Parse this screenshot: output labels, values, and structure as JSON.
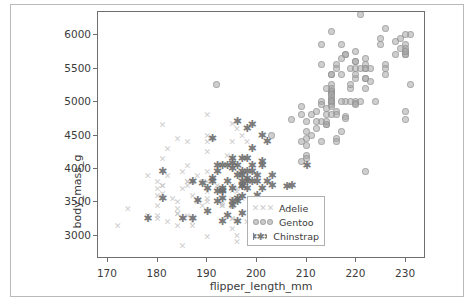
{
  "figure": {
    "background": "#ffffff",
    "frame_color": "#b9b9b9",
    "axes_edge_color": "#6e6e6e"
  },
  "chart_data": {
    "type": "scatter",
    "title": "",
    "xlabel": "flipper_length_mm",
    "ylabel": "body_mass_g",
    "xlim": [
      168,
      234
    ],
    "ylim": [
      2650,
      6350
    ],
    "xticks": [
      170,
      180,
      190,
      200,
      210,
      220,
      230
    ],
    "xticklabels": [
      "170",
      "180",
      "190",
      "200",
      "210",
      "220",
      "230"
    ],
    "yticks": [
      3000,
      3500,
      4000,
      4500,
      5000,
      5500,
      6000
    ],
    "yticklabels": [
      "3000",
      "3500",
      "4000",
      "4500",
      "5000",
      "5500",
      "6000"
    ],
    "grid": false,
    "legend": {
      "position": "lower right",
      "entries": [
        {
          "label": "Adelie",
          "marker": "x",
          "color": "#c4c4c4"
        },
        {
          "label": "Gentoo",
          "marker": "o",
          "color": "#a8a8a8"
        },
        {
          "label": "Chinstrap",
          "marker": "star",
          "color": "#6e6e6e"
        }
      ]
    },
    "series": [
      {
        "name": "Adelie",
        "marker": "x",
        "color": "#c4c4c4",
        "points": [
          [
            181,
            3750
          ],
          [
            186,
            3800
          ],
          [
            195,
            3250
          ],
          [
            193,
            3450
          ],
          [
            190,
            3650
          ],
          [
            181,
            3625
          ],
          [
            195,
            4675
          ],
          [
            193,
            3475
          ],
          [
            190,
            4250
          ],
          [
            186,
            3300
          ],
          [
            180,
            3700
          ],
          [
            182,
            3200
          ],
          [
            191,
            3800
          ],
          [
            198,
            4400
          ],
          [
            185,
            3700
          ],
          [
            195,
            3450
          ],
          [
            197,
            4500
          ],
          [
            184,
            3325
          ],
          [
            194,
            4200
          ],
          [
            174,
            3400
          ],
          [
            180,
            3600
          ],
          [
            189,
            3800
          ],
          [
            185,
            3950
          ],
          [
            180,
            3800
          ],
          [
            187,
            3800
          ],
          [
            183,
            3550
          ],
          [
            187,
            3200
          ],
          [
            172,
            3150
          ],
          [
            180,
            3250
          ],
          [
            178,
            3900
          ],
          [
            178,
            3300
          ],
          [
            188,
            3900
          ],
          [
            184,
            3325
          ],
          [
            195,
            4150
          ],
          [
            196,
            3950
          ],
          [
            190,
            3550
          ],
          [
            180,
            3300
          ],
          [
            181,
            4650
          ],
          [
            184,
            3150
          ],
          [
            182,
            3900
          ],
          [
            195,
            3100
          ],
          [
            186,
            4400
          ],
          [
            196,
            3000
          ],
          [
            196,
            4600
          ],
          [
            195,
            3425
          ],
          [
            190,
            2975
          ],
          [
            180,
            3450
          ],
          [
            181,
            4150
          ],
          [
            184,
            3500
          ],
          [
            182,
            4300
          ],
          [
            195,
            3450
          ],
          [
            186,
            4050
          ],
          [
            196,
            2900
          ],
          [
            196,
            3700
          ],
          [
            195,
            3550
          ],
          [
            190,
            3800
          ],
          [
            185,
            2850
          ],
          [
            186,
            3750
          ],
          [
            187,
            3150
          ],
          [
            190,
            4400
          ],
          [
            187,
            3600
          ],
          [
            195,
            4050
          ],
          [
            192,
            3750
          ],
          [
            184,
            4450
          ],
          [
            192,
            3700
          ],
          [
            195,
            4400
          ],
          [
            188,
            3500
          ],
          [
            190,
            4500
          ],
          [
            198,
            3200
          ],
          [
            190,
            4800
          ],
          [
            190,
            3950
          ],
          [
            196,
            3650
          ],
          [
            197,
            3550
          ],
          [
            190,
            3500
          ],
          [
            195,
            3675
          ],
          [
            191,
            4450
          ],
          [
            184,
            3400
          ],
          [
            187,
            3800
          ],
          [
            195,
            3750
          ],
          [
            189,
            3450
          ],
          [
            181,
            3750
          ],
          [
            186,
            3800
          ],
          [
            195,
            3250
          ],
          [
            193,
            3450
          ]
        ]
      },
      {
        "name": "Gentoo",
        "marker": "o",
        "color": "#a8a8a8",
        "points": [
          [
            211,
            4500
          ],
          [
            230,
            5700
          ],
          [
            210,
            4450
          ],
          [
            218,
            5700
          ],
          [
            215,
            5400
          ],
          [
            210,
            4550
          ],
          [
            211,
            4800
          ],
          [
            219,
            5200
          ],
          [
            209,
            4400
          ],
          [
            215,
            5150
          ],
          [
            214,
            4650
          ],
          [
            216,
            5550
          ],
          [
            214,
            4650
          ],
          [
            213,
            5850
          ],
          [
            210,
            4200
          ],
          [
            217,
            5850
          ],
          [
            210,
            4150
          ],
          [
            221,
            6300
          ],
          [
            209,
            4800
          ],
          [
            222,
            5350
          ],
          [
            218,
            5700
          ],
          [
            215,
            5000
          ],
          [
            213,
            4400
          ],
          [
            215,
            5050
          ],
          [
            215,
            5000
          ],
          [
            215,
            5100
          ],
          [
            222,
            5650
          ],
          [
            212,
            4600
          ],
          [
            213,
            5550
          ],
          [
            192,
            5250
          ],
          [
            213,
            4700
          ],
          [
            215,
            5050
          ],
          [
            215,
            6050
          ],
          [
            215,
            5150
          ],
          [
            215,
            5400
          ],
          [
            215,
            4950
          ],
          [
            215,
            5250
          ],
          [
            210,
            4350
          ],
          [
            220,
            5350
          ],
          [
            222,
            3950
          ],
          [
            209,
            4100
          ],
          [
            207,
            4725
          ],
          [
            230,
            4725
          ],
          [
            220,
            5000
          ],
          [
            230,
            4850
          ],
          [
            220,
            5750
          ],
          [
            222,
            5200
          ],
          [
            209,
            4925
          ],
          [
            220,
            4975
          ],
          [
            219,
            5500
          ],
          [
            215,
            5000
          ],
          [
            222,
            5500
          ],
          [
            215,
            4925
          ],
          [
            223,
            5500
          ],
          [
            212,
            4700
          ],
          [
            220,
            5400
          ],
          [
            218,
            4775
          ],
          [
            216,
            5500
          ],
          [
            210,
            4700
          ],
          [
            220,
            5600
          ],
          [
            214,
            4700
          ],
          [
            225,
            5850
          ],
          [
            218,
            5000
          ],
          [
            231,
            6000
          ],
          [
            213,
            5000
          ],
          [
            230,
            5750
          ],
          [
            216,
            4450
          ],
          [
            230,
            5850
          ],
          [
            216,
            4850
          ],
          [
            226,
            6100
          ],
          [
            215,
            5150
          ],
          [
            230,
            5700
          ],
          [
            222,
            5350
          ],
          [
            226,
            5550
          ],
          [
            203,
            4500
          ],
          [
            219,
            5250
          ],
          [
            215,
            5100
          ],
          [
            220,
            5500
          ],
          [
            216,
            4800
          ],
          [
            228,
            5900
          ],
          [
            217,
            5400
          ],
          [
            230,
            5800
          ],
          [
            214,
            4900
          ],
          [
            228,
            5700
          ],
          [
            217,
            5650
          ],
          [
            223,
            5300
          ],
          [
            214,
            4800
          ],
          [
            226,
            5400
          ],
          [
            213,
            4950
          ],
          [
            231,
            5250
          ],
          [
            215,
            5200
          ],
          [
            221,
            5500
          ],
          [
            218,
            4750
          ],
          [
            225,
            5950
          ],
          [
            212,
            4850
          ],
          [
            224,
            5000
          ],
          [
            216,
            4400
          ],
          [
            230,
            6000
          ],
          [
            217,
            5000
          ],
          [
            222,
            5550
          ],
          [
            219,
            5000
          ],
          [
            229,
            5950
          ],
          [
            217,
            4550
          ],
          [
            220,
            5600
          ],
          [
            214,
            5200
          ],
          [
            222,
            5500
          ],
          [
            215,
            4800
          ],
          [
            229,
            5800
          ],
          [
            221,
            5000
          ],
          [
            230,
            5750
          ],
          [
            220,
            4950
          ],
          [
            226,
            5500
          ]
        ]
      },
      {
        "name": "Chinstrap",
        "marker": "star",
        "color": "#6e6e6e",
        "points": [
          [
            192,
            3500
          ],
          [
            196,
            3900
          ],
          [
            193,
            3650
          ],
          [
            188,
            3525
          ],
          [
            197,
            3725
          ],
          [
            198,
            3950
          ],
          [
            178,
            3250
          ],
          [
            197,
            3750
          ],
          [
            195,
            4150
          ],
          [
            198,
            3700
          ],
          [
            193,
            4050
          ],
          [
            194,
            3800
          ],
          [
            185,
            3250
          ],
          [
            201,
            4050
          ],
          [
            190,
            3350
          ],
          [
            201,
            4100
          ],
          [
            197,
            3325
          ],
          [
            181,
            3550
          ],
          [
            190,
            3700
          ],
          [
            195,
            4000
          ],
          [
            181,
            3950
          ],
          [
            191,
            3850
          ],
          [
            187,
            3800
          ],
          [
            203,
            3750
          ],
          [
            202,
            4400
          ],
          [
            194,
            4050
          ],
          [
            206,
            3725
          ],
          [
            189,
            3775
          ],
          [
            195,
            4075
          ],
          [
            207,
            3750
          ],
          [
            202,
            3800
          ],
          [
            193,
            3700
          ],
          [
            210,
            4050
          ],
          [
            197,
            3575
          ],
          [
            199,
            4050
          ],
          [
            194,
            3300
          ],
          [
            195,
            3700
          ],
          [
            199,
            3800
          ],
          [
            193,
            3675
          ],
          [
            187,
            3250
          ],
          [
            198,
            3850
          ],
          [
            199,
            3950
          ],
          [
            196,
            3200
          ],
          [
            198,
            4150
          ],
          [
            201,
            3700
          ],
          [
            200,
            3800
          ],
          [
            192,
            4050
          ],
          [
            196,
            3550
          ],
          [
            193,
            3200
          ],
          [
            198,
            3800
          ],
          [
            191,
            4450
          ],
          [
            197,
            3900
          ],
          [
            193,
            3550
          ],
          [
            199,
            4300
          ],
          [
            195,
            3450
          ],
          [
            196,
            4050
          ],
          [
            200,
            3600
          ],
          [
            197,
            3800
          ],
          [
            201,
            4500
          ],
          [
            197,
            3950
          ],
          [
            191,
            3800
          ],
          [
            195,
            3500
          ],
          [
            200,
            3900
          ],
          [
            198,
            4600
          ],
          [
            196,
            3500
          ],
          [
            203,
            3900
          ],
          [
            197,
            4150
          ],
          [
            192,
            3950
          ],
          [
            199,
            4650
          ],
          [
            192,
            3650
          ],
          [
            196,
            4700
          ]
        ]
      }
    ]
  }
}
